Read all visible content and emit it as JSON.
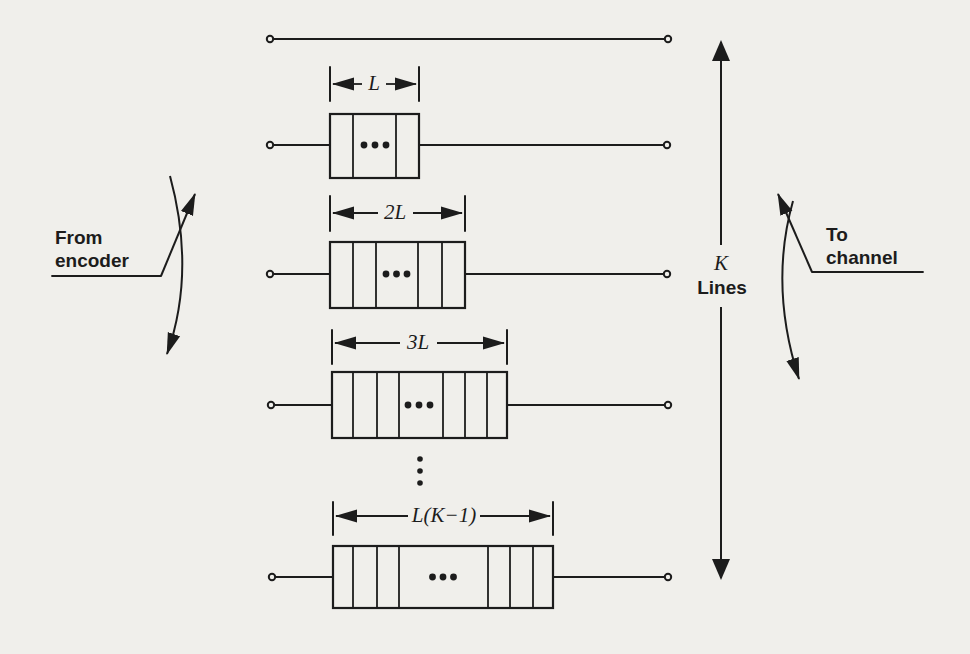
{
  "labels": {
    "source_line1": "From",
    "source_line2": "encoder",
    "sink_line1": "To",
    "sink_line2": "channel",
    "k_count": "K",
    "k_lines_word": "Lines"
  },
  "structure": {
    "rows": [
      {
        "row": 1,
        "delay_box": false,
        "delay_label": ""
      },
      {
        "row": 2,
        "delay_box": true,
        "delay_label": "L",
        "cells_left": 1,
        "cells_right": 1
      },
      {
        "row": 3,
        "delay_box": true,
        "delay_label": "2L",
        "cells_left": 2,
        "cells_right": 2
      },
      {
        "row": 4,
        "delay_box": true,
        "delay_label": "3L",
        "cells_left": 3,
        "cells_right": 3
      },
      {
        "row": 5,
        "delay_box": true,
        "delay_label": "L(K−1)",
        "cells_left": 3,
        "cells_right": 3
      }
    ]
  },
  "colors": {
    "ink": "#1c1c1c",
    "paper": "#f0efeb"
  }
}
